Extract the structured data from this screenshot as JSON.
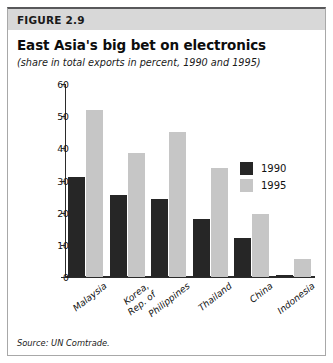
{
  "figure": {
    "number_label": "FIGURE 2.9",
    "title": "East Asia's big bet on electronics",
    "subtitle": "(share in total exports in percent, 1990 and 1995)",
    "source": "Source: UN Comtrade."
  },
  "colors": {
    "series_1990": "#262626",
    "series_1995": "#c6c6c6",
    "header_band": "#d8d8d8",
    "axis": "#2b2b2b",
    "frame": "#a8a8a8"
  },
  "legend": {
    "position": "inside-right",
    "entries": [
      {
        "label": "1990",
        "color": "#262626"
      },
      {
        "label": "1995",
        "color": "#c6c6c6"
      }
    ]
  },
  "axis": {
    "y_ticks": [
      "0",
      "10",
      "20",
      "30",
      "40",
      "50",
      "60"
    ]
  },
  "x_labels": [
    {
      "line1": "Malaysia",
      "line2": ""
    },
    {
      "line1": "Korea,",
      "line2": "Rep. of"
    },
    {
      "line1": "Philippines",
      "line2": ""
    },
    {
      "line1": "Thailand",
      "line2": ""
    },
    {
      "line1": "China",
      "line2": ""
    },
    {
      "line1": "Indonesia",
      "line2": ""
    }
  ],
  "chart_data": {
    "type": "bar",
    "title": "East Asia's big bet on electronics",
    "subtitle": "(share in total exports in percent, 1990 and 1995)",
    "xlabel": "",
    "ylabel": "",
    "ylim": [
      0,
      60
    ],
    "ytick_step": 10,
    "grid": false,
    "legend_position": "inside-right",
    "categories": [
      "Malaysia",
      "Korea, Rep. of",
      "Philippines",
      "Thailand",
      "China",
      "Indonesia"
    ],
    "series": [
      {
        "name": "1990",
        "color": "#262626",
        "values": [
          31.2,
          25.6,
          24.2,
          18.0,
          12.2,
          0.5
        ]
      },
      {
        "name": "1995",
        "color": "#c6c6c6",
        "values": [
          51.8,
          38.7,
          45.1,
          34.0,
          19.6,
          5.5
        ]
      }
    ],
    "source": "Source: UN Comtrade."
  }
}
